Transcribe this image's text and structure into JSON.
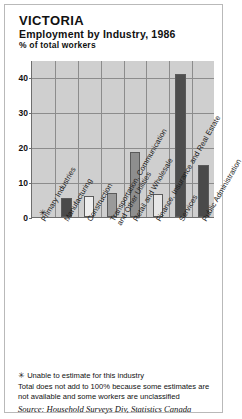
{
  "frame": {
    "border_color": "#b9b9b9"
  },
  "header": {
    "title": "VICTORIA",
    "subtitle": "Employment by Industry, 1986",
    "axis_note": "% of total workers"
  },
  "footnotes": {
    "star_marker": "✳",
    "star_note": "Unable to estimate for this industry",
    "total_note": "Total does not add to 100% because some estimates are not available and some workers are unclassified",
    "source": "Source: Household Surveys Div, Statistics Canada"
  },
  "chart_data": {
    "type": "bar",
    "title": "Employment by Industry, 1986",
    "subtitle": "VICTORIA",
    "xlabel": "",
    "ylabel": "% of total workers",
    "ylim": [
      0,
      45
    ],
    "yticks": [
      0,
      10,
      20,
      30,
      40
    ],
    "ytick_labels": [
      "0",
      "10",
      "20",
      "30",
      "40"
    ],
    "grid": true,
    "legend": "none",
    "categories": [
      "Primary Industries",
      "Manufacturing",
      "Construction",
      "Transportation, Communication and Other Utilities",
      "Retail and Wholesale",
      "Finance, Insurance and Real Estate",
      "Services",
      "Public Administration"
    ],
    "category_lines": [
      [
        "Primary Industries"
      ],
      [
        "Manufacturing"
      ],
      [
        "Construction"
      ],
      [
        "Transportation, Communication",
        "and Other Utilities"
      ],
      [
        "Retail and Wholesale"
      ],
      [
        "Finance, Insurance and Real Estate"
      ],
      [
        "Services"
      ],
      [
        "Public Administration"
      ]
    ],
    "values": [
      null,
      5.5,
      6.0,
      6.8,
      18.5,
      6.7,
      41.0,
      15.0
    ],
    "value_markers": [
      "✳",
      "",
      "",
      "",
      "",
      "",
      "",
      ""
    ],
    "bar_colors": [
      "none",
      "#4a4a4a",
      "#eeeeee",
      "#9a9a9a",
      "#8e8e8e",
      "#e6e6e6",
      "#4e4e4e",
      "#4a4a4a"
    ],
    "plot_background": "#cfcfcf",
    "grid_color": "#8c8c8c",
    "axis_color": "#6e6e6e"
  }
}
